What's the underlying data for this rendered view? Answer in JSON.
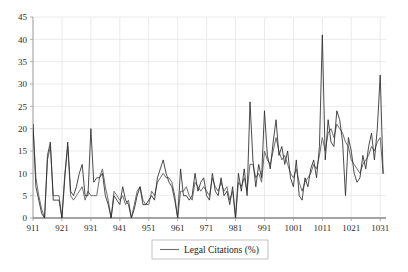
{
  "chart_data": {
    "type": "line",
    "title": "",
    "subtitle": "",
    "xlabel": "",
    "ylabel": "",
    "xlim": [
      911,
      1033
    ],
    "ylim": [
      0,
      45
    ],
    "grid": true,
    "legend_position": "bottom-center",
    "legend": [
      {
        "name": "Legal Citations (%)",
        "style": "solid",
        "color": "#6e6e6e"
      }
    ],
    "yticks": [
      0,
      5,
      10,
      15,
      20,
      25,
      30,
      35,
      40,
      45
    ],
    "ytick_labels": [
      "0",
      "5",
      "10",
      "15",
      "20",
      "25",
      "30",
      "35",
      "40",
      "45"
    ],
    "xticks": [
      911,
      921,
      931,
      941,
      951,
      961,
      971,
      981,
      991,
      1001,
      1011,
      1021,
      1031
    ],
    "xtick_labels": [
      "911",
      "921",
      "931",
      "941",
      "951",
      "961",
      "971",
      "981",
      "991",
      "1001",
      "1011",
      "1021",
      "1031"
    ],
    "x": [
      911,
      912,
      913,
      914,
      915,
      916,
      917,
      918,
      919,
      920,
      921,
      922,
      923,
      924,
      925,
      926,
      927,
      928,
      929,
      930,
      931,
      932,
      933,
      934,
      935,
      936,
      937,
      938,
      939,
      940,
      941,
      942,
      943,
      944,
      945,
      946,
      947,
      948,
      949,
      950,
      951,
      952,
      953,
      954,
      955,
      956,
      957,
      958,
      959,
      960,
      961,
      962,
      963,
      964,
      965,
      966,
      967,
      968,
      969,
      970,
      971,
      972,
      973,
      974,
      975,
      976,
      977,
      978,
      979,
      980,
      981,
      982,
      983,
      984,
      985,
      986,
      987,
      988,
      989,
      990,
      991,
      992,
      993,
      994,
      995,
      996,
      997,
      998,
      999,
      1000,
      1001,
      1002,
      1003,
      1004,
      1005,
      1006,
      1007,
      1008,
      1009,
      1010,
      1011,
      1012,
      1013,
      1014,
      1015,
      1016,
      1017,
      1018,
      1019,
      1020,
      1021,
      1022,
      1023,
      1024,
      1025,
      1026,
      1027,
      1028,
      1029,
      1030,
      1031,
      1032
    ],
    "series": [
      {
        "name": "Legal Citations (%)",
        "style": "solid",
        "color": "#6e6e6e",
        "values": [
          21,
          9,
          5,
          2,
          0,
          13,
          16,
          5,
          5,
          5,
          0,
          10,
          16,
          5,
          4,
          5,
          6,
          7,
          4,
          6,
          5,
          5,
          5,
          9,
          11,
          7,
          4,
          0,
          6,
          5,
          4,
          5,
          3,
          4,
          0,
          3,
          6,
          7,
          4,
          3,
          3,
          6,
          5,
          8,
          9,
          10,
          9,
          9,
          8,
          5,
          0,
          6,
          6,
          7,
          5,
          4,
          8,
          7,
          6,
          7,
          6,
          5,
          9,
          7,
          6,
          8,
          6,
          7,
          4,
          6,
          0,
          8,
          7,
          9,
          6,
          12,
          12,
          9,
          10,
          8,
          15,
          13,
          12,
          15,
          18,
          15,
          13,
          14,
          12,
          10,
          9,
          11,
          8,
          6,
          8,
          9,
          10,
          12,
          11,
          14,
          18,
          15,
          19,
          20,
          18,
          21,
          20,
          19,
          17,
          16,
          13,
          12,
          11,
          10,
          12,
          13,
          14,
          16,
          15,
          17,
          18,
          10
        ]
      },
      {
        "name": "Legal Citations (%) - secondary",
        "style": "dashed-dark",
        "color": "#2b2b2b",
        "values": [
          21,
          7,
          4,
          1,
          0,
          14,
          17,
          4,
          4,
          4,
          0,
          9,
          17,
          6,
          5,
          7,
          10,
          12,
          5,
          5,
          20,
          8,
          9,
          9,
          10,
          5,
          3,
          0,
          5,
          4,
          3,
          7,
          4,
          3,
          0,
          2,
          5,
          7,
          3,
          3,
          4,
          5,
          4,
          9,
          11,
          13,
          10,
          8,
          7,
          4,
          0,
          11,
          5,
          5,
          4,
          5,
          10,
          6,
          8,
          9,
          5,
          4,
          10,
          6,
          5,
          9,
          5,
          6,
          3,
          7,
          0,
          10,
          6,
          11,
          5,
          26,
          13,
          7,
          12,
          9,
          24,
          14,
          11,
          17,
          22,
          14,
          16,
          12,
          15,
          9,
          7,
          13,
          5,
          4,
          9,
          7,
          11,
          13,
          9,
          16,
          41,
          13,
          22,
          17,
          16,
          24,
          22,
          17,
          5,
          18,
          15,
          10,
          8,
          9,
          14,
          11,
          16,
          19,
          13,
          20,
          32,
          10
        ]
      }
    ]
  },
  "legend_box": {
    "entry_label": "Legal Citations (%)"
  },
  "axes": {
    "y_top_label": "45",
    "y_bottom_label": "0",
    "x_first_label": "911",
    "x_last_label": "1031"
  },
  "colors": {
    "series_primary": "#6e6e6e",
    "series_secondary": "#2b2b2b",
    "grid": "#e2e2e2",
    "axis": "#9a9a9a",
    "text": "#1a1a1a",
    "background": "#ffffff"
  }
}
